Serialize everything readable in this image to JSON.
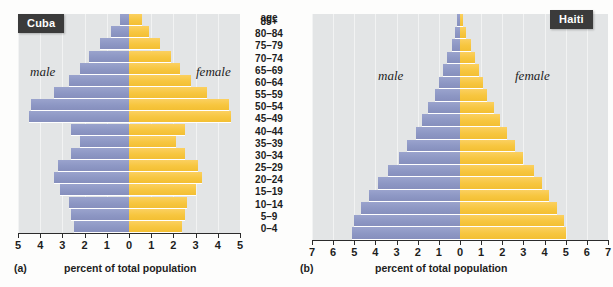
{
  "figure": {
    "age_header": "age",
    "age_groups": [
      "85+",
      "80–84",
      "75–79",
      "70–74",
      "65–69",
      "60–64",
      "55–59",
      "50–54",
      "45–49",
      "40–44",
      "35–39",
      "30–34",
      "25–29",
      "20–24",
      "15–19",
      "10–14",
      "5–9",
      "0–4"
    ],
    "male_label": "male",
    "female_label": "female",
    "colors": {
      "male": "#8d97c4",
      "female": "#f7c63f",
      "plot_background": "#e3e5e6",
      "badge_background": "#3b3b3b",
      "axis": "#2b2b2b"
    }
  },
  "panel_a": {
    "tag": "(a)",
    "title": "Cuba",
    "xlabel": "percent of total population"
  },
  "panel_b": {
    "tag": "(b)",
    "title": "Haiti",
    "xlabel": "percent of total population"
  },
  "chart_data": [
    {
      "type": "bar",
      "title": "Cuba",
      "subtitle": "(a)",
      "orientation": "horizontal-diverging",
      "xlabel": "percent of total population",
      "ylabel": "age",
      "categories": [
        "0–4",
        "5–9",
        "10–14",
        "15–19",
        "20–24",
        "25–29",
        "30–34",
        "35–39",
        "40–44",
        "45–49",
        "50–54",
        "55–59",
        "60–64",
        "65–69",
        "70–74",
        "75–79",
        "80–84",
        "85+"
      ],
      "tick_labels": [
        "5",
        "4",
        "3",
        "2",
        "1",
        "0",
        "1",
        "2",
        "3",
        "4",
        "5"
      ],
      "xlim": [
        -5,
        5
      ],
      "grid": true,
      "legend": [
        "male",
        "female"
      ],
      "legend_position": "inside-left-and-right",
      "series": [
        {
          "name": "male",
          "values": [
            2.5,
            2.6,
            2.7,
            3.1,
            3.4,
            3.2,
            2.6,
            2.2,
            2.6,
            4.5,
            4.4,
            3.4,
            2.7,
            2.2,
            1.8,
            1.3,
            0.8,
            0.4
          ]
        },
        {
          "name": "female",
          "values": [
            2.4,
            2.5,
            2.6,
            3.0,
            3.3,
            3.1,
            2.5,
            2.1,
            2.5,
            4.6,
            4.5,
            3.5,
            2.8,
            2.3,
            1.9,
            1.4,
            0.9,
            0.6
          ]
        }
      ]
    },
    {
      "type": "bar",
      "title": "Haiti",
      "subtitle": "(b)",
      "orientation": "horizontal-diverging",
      "xlabel": "percent of total population",
      "ylabel": "age",
      "categories": [
        "0–4",
        "5–9",
        "10–14",
        "15–19",
        "20–24",
        "25–29",
        "30–34",
        "35–39",
        "40–44",
        "45–49",
        "50–54",
        "55–59",
        "60–64",
        "65–69",
        "70–74",
        "75–79",
        "80–84",
        "85+"
      ],
      "tick_labels": [
        "7",
        "6",
        "5",
        "4",
        "3",
        "2",
        "1",
        "0",
        "1",
        "2",
        "3",
        "4",
        "5",
        "6",
        "7"
      ],
      "xlim": [
        -7,
        7
      ],
      "grid": true,
      "legend": [
        "male",
        "female"
      ],
      "legend_position": "inside-left-and-right",
      "series": [
        {
          "name": "male",
          "values": [
            5.1,
            5.0,
            4.7,
            4.3,
            3.9,
            3.4,
            2.9,
            2.5,
            2.1,
            1.8,
            1.5,
            1.2,
            1.0,
            0.8,
            0.6,
            0.4,
            0.25,
            0.12
          ]
        },
        {
          "name": "female",
          "values": [
            5.0,
            4.9,
            4.6,
            4.2,
            3.9,
            3.5,
            3.0,
            2.6,
            2.2,
            1.9,
            1.6,
            1.3,
            1.1,
            0.9,
            0.7,
            0.5,
            0.3,
            0.15
          ]
        }
      ]
    }
  ]
}
